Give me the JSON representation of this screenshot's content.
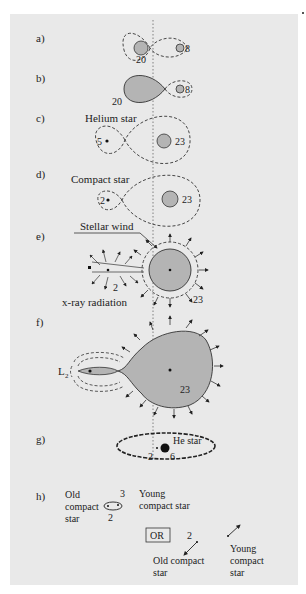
{
  "figure": {
    "colors": {
      "panel_bg": "#e9e9e9",
      "star_fill": "#b4b4b4",
      "ink": "#222222"
    }
  },
  "panels": [
    {
      "id": "a",
      "label": "a)",
      "masses": [
        "20",
        "8"
      ]
    },
    {
      "id": "b",
      "label": "b)",
      "masses": [
        "20",
        "8"
      ]
    },
    {
      "id": "c",
      "label": "c)",
      "caption": "Helium star",
      "masses": [
        "5",
        "23"
      ]
    },
    {
      "id": "d",
      "label": "d)",
      "caption": "Compact star",
      "masses": [
        "2",
        "23"
      ]
    },
    {
      "id": "e",
      "label": "e)",
      "caption_top": "Stellar wind",
      "caption_bottom": "x-ray radiation",
      "masses": [
        "2",
        "23"
      ]
    },
    {
      "id": "f",
      "label": "f)",
      "lagrange_point": "L",
      "lagrange_sub": "2",
      "masses": [
        "23"
      ]
    },
    {
      "id": "g",
      "label": "g)",
      "caption": "He star",
      "masses": [
        "2",
        "6"
      ]
    },
    {
      "id": "h",
      "label": "h)",
      "old_star": [
        "Old",
        "compact",
        "star"
      ],
      "young_star": [
        "Young",
        "compact star"
      ],
      "masses": [
        "3",
        "2"
      ],
      "or_label": "OR",
      "alt_mass": "2",
      "alt_old": [
        "Old compact",
        "star"
      ],
      "alt_young": [
        "Young",
        "compact",
        "star"
      ]
    }
  ]
}
